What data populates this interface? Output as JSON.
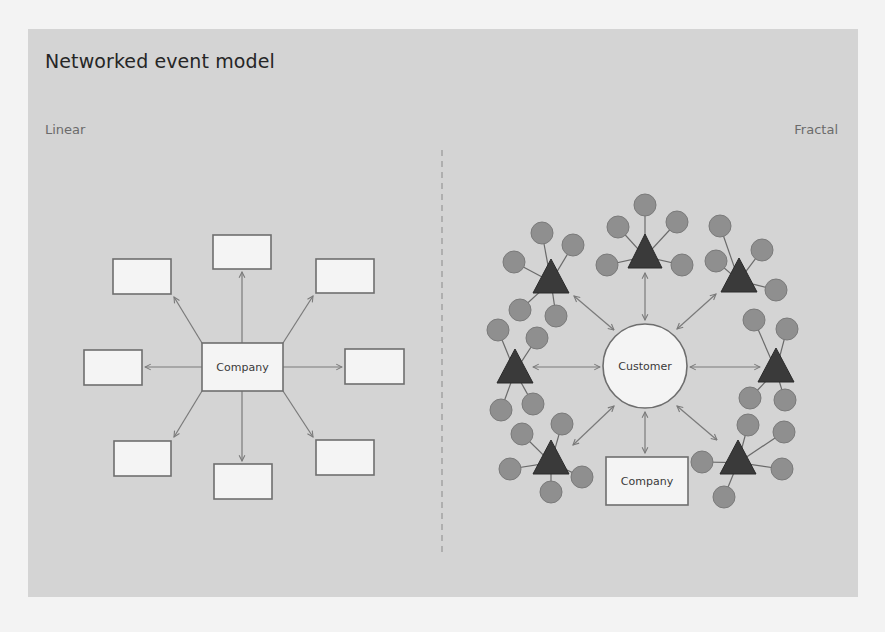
{
  "title": "Networked event model",
  "sections": {
    "left": {
      "label": "Linear",
      "center_label": "Company"
    },
    "right": {
      "label": "Fractal",
      "center_label": "Customer",
      "company_label": "Company"
    }
  },
  "colors": {
    "page_bg": "#f3f3f3",
    "panel_bg": "#d4d4d4",
    "box_fill": "#f4f4f4",
    "box_stroke": "#6e6e6e",
    "arrow": "#7a7a7a",
    "triangle": "#3a3a3a",
    "satellite": "#8f8f8f",
    "divider": "#8a8a8a"
  },
  "linear": {
    "center": {
      "x": 202,
      "y": 343,
      "w": 81,
      "h": 48
    },
    "boxes": [
      {
        "x": 213,
        "y": 235,
        "w": 58,
        "h": 34
      },
      {
        "x": 316,
        "y": 259,
        "w": 58,
        "h": 34
      },
      {
        "x": 345,
        "y": 349,
        "w": 59,
        "h": 35
      },
      {
        "x": 316,
        "y": 440,
        "w": 58,
        "h": 35
      },
      {
        "x": 214,
        "y": 464,
        "w": 58,
        "h": 35
      },
      {
        "x": 114,
        "y": 441,
        "w": 57,
        "h": 35
      },
      {
        "x": 84,
        "y": 350,
        "w": 58,
        "h": 35
      },
      {
        "x": 113,
        "y": 259,
        "w": 58,
        "h": 35
      }
    ],
    "arrows": [
      {
        "x1": 242,
        "y1": 343,
        "x2": 242,
        "y2": 272
      },
      {
        "x1": 283,
        "y1": 343,
        "x2": 313,
        "y2": 296
      },
      {
        "x1": 283,
        "y1": 367,
        "x2": 342,
        "y2": 367
      },
      {
        "x1": 283,
        "y1": 391,
        "x2": 313,
        "y2": 437
      },
      {
        "x1": 242,
        "y1": 391,
        "x2": 242,
        "y2": 461
      },
      {
        "x1": 202,
        "y1": 391,
        "x2": 174,
        "y2": 437
      },
      {
        "x1": 202,
        "y1": 367,
        "x2": 145,
        "y2": 367
      },
      {
        "x1": 202,
        "y1": 343,
        "x2": 174,
        "y2": 297
      }
    ]
  },
  "fractal": {
    "customer": {
      "cx": 645,
      "cy": 366,
      "r": 42
    },
    "company": {
      "x": 606,
      "y": 457,
      "w": 82,
      "h": 48
    },
    "clusters": [
      {
        "apex": [
          645,
          234
        ],
        "base": [
          628,
          662,
          268
        ],
        "sats": [
          [
            645,
            205
          ],
          [
            618,
            227
          ],
          [
            677,
            222
          ],
          [
            607,
            265
          ],
          [
            682,
            265
          ]
        ]
      },
      {
        "apex": [
          551,
          259
        ],
        "base": [
          533,
          569,
          293
        ],
        "sats": [
          [
            542,
            233
          ],
          [
            573,
            245
          ],
          [
            514,
            262
          ],
          [
            520,
            310
          ],
          [
            556,
            316
          ]
        ]
      },
      {
        "apex": [
          739,
          258
        ],
        "base": [
          721,
          757,
          292
        ],
        "sats": [
          [
            720,
            226
          ],
          [
            762,
            250
          ],
          [
            716,
            261
          ],
          [
            776,
            290
          ]
        ]
      },
      {
        "apex": [
          515,
          349
        ],
        "base": [
          497,
          533,
          383
        ],
        "sats": [
          [
            498,
            330
          ],
          [
            537,
            338
          ],
          [
            501,
            410
          ],
          [
            533,
            404
          ]
        ]
      },
      {
        "apex": [
          776,
          348
        ],
        "base": [
          758,
          794,
          382
        ],
        "sats": [
          [
            754,
            320
          ],
          [
            787,
            329
          ],
          [
            750,
            398
          ],
          [
            785,
            400
          ]
        ]
      },
      {
        "apex": [
          551,
          440
        ],
        "base": [
          533,
          569,
          474
        ],
        "sats": [
          [
            522,
            434
          ],
          [
            562,
            424
          ],
          [
            510,
            469
          ],
          [
            582,
            477
          ],
          [
            551,
            492
          ]
        ]
      },
      {
        "apex": [
          738,
          440
        ],
        "base": [
          720,
          756,
          474
        ],
        "sats": [
          [
            748,
            425
          ],
          [
            784,
            432
          ],
          [
            702,
            462
          ],
          [
            782,
            469
          ],
          [
            724,
            497
          ]
        ]
      }
    ],
    "arrows": [
      {
        "x1": 645,
        "y1": 273,
        "x2": 645,
        "y2": 320
      },
      {
        "x1": 574,
        "y1": 296,
        "x2": 614,
        "y2": 330
      },
      {
        "x1": 716,
        "y1": 294,
        "x2": 677,
        "y2": 329
      },
      {
        "x1": 533,
        "y1": 367,
        "x2": 600,
        "y2": 367
      },
      {
        "x1": 690,
        "y1": 367,
        "x2": 760,
        "y2": 367
      },
      {
        "x1": 573,
        "y1": 445,
        "x2": 614,
        "y2": 406
      },
      {
        "x1": 717,
        "y1": 440,
        "x2": 677,
        "y2": 406
      },
      {
        "x1": 645,
        "y1": 412,
        "x2": 645,
        "y2": 453
      }
    ]
  },
  "divider": {
    "x": 442,
    "y1": 150,
    "y2": 556
  }
}
